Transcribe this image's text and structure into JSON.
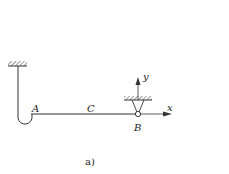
{
  "diagram": {
    "type": "mechanics-beam-support",
    "labels": {
      "point_a": "A",
      "point_c": "C",
      "point_b": "B",
      "axis_x": "x",
      "axis_y": "y"
    },
    "caption": "a)",
    "colors": {
      "line": "#333333",
      "background": "#ffffff"
    }
  }
}
